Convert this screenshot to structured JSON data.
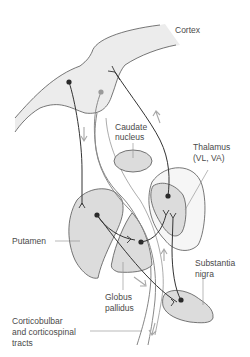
{
  "diagram": {
    "labels": {
      "cortex": "Cortex",
      "caudate": [
        "Caudate",
        "nucleus"
      ],
      "thalamus": [
        "Thalamus",
        "(VL, VA)"
      ],
      "putamen": "Putamen",
      "substantia_nigra": [
        "Substantia",
        "nigra"
      ],
      "globus_pallidus": [
        "Globus",
        "pallidus"
      ],
      "tracts": [
        "Corticobulbar",
        "and corticospinal",
        "tracts"
      ]
    },
    "colors": {
      "structure_fill_light": "#ececec",
      "structure_fill": "#dcdcdc",
      "outline": "#555555",
      "neuron_dark": "#2a2a2a",
      "neuron_grey": "#9a9a9a",
      "arrow": "#a8a8a8",
      "leader": "#8a8a8a"
    }
  }
}
